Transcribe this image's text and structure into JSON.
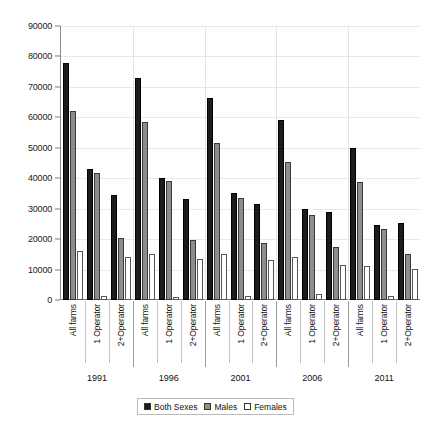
{
  "chart_data": {
    "type": "bar",
    "title": "",
    "subtitle": "",
    "xlabel": "",
    "ylabel": "",
    "ylim": [
      0,
      90000
    ],
    "ytick_step": 10000,
    "yticks": [
      "90000",
      "80000",
      "70000",
      "60000",
      "50000",
      "40000",
      "30000",
      "20000",
      "10000",
      "0"
    ],
    "grid": true,
    "legend_position": "bottom",
    "group_labels": [
      "1991",
      "1996",
      "2001",
      "2006",
      "2011"
    ],
    "categories": [
      "All farms",
      "1 Operator",
      "2+Operator"
    ],
    "series": [
      {
        "name": "Both Sexes",
        "color": "#1c1c1c",
        "values_by_group": {
          "1991": [
            78000,
            43000,
            34500
          ],
          "1996": [
            73000,
            40000,
            33200
          ],
          "2001": [
            66500,
            35000,
            31700
          ],
          "2006": [
            59000,
            30000,
            28800
          ],
          "2011": [
            49800,
            24500,
            25200
          ]
        }
      },
      {
        "name": "Males",
        "color": "#8d8d8d",
        "values_by_group": {
          "1991": [
            62000,
            41800,
            20500
          ],
          "1996": [
            58500,
            39200,
            19800
          ],
          "2001": [
            51700,
            33400,
            18600
          ],
          "2006": [
            45200,
            28000,
            17300
          ],
          "2011": [
            38700,
            23300,
            15100
          ]
        }
      },
      {
        "name": "Females",
        "color": "#ffffff",
        "values_by_group": {
          "1991": [
            16200,
            1300,
            14000
          ],
          "1996": [
            15000,
            1100,
            13400
          ],
          "2001": [
            15000,
            1400,
            13100
          ],
          "2006": [
            14000,
            2000,
            11600
          ],
          "2011": [
            11300,
            1300,
            10100
          ]
        }
      }
    ]
  },
  "legend": {
    "items": [
      {
        "label": "Both Sexes",
        "swatch": "filled-black"
      },
      {
        "label": "Males",
        "swatch": "filled-gray"
      },
      {
        "label": "Females",
        "swatch": "outline-white"
      }
    ]
  },
  "colors": {
    "both_sexes": "#1c1c1c",
    "males": "#8d8d8d",
    "females": "#ffffff",
    "axis": "#7a7a7a",
    "grid": "#e9e9e9",
    "text": "#111111"
  }
}
